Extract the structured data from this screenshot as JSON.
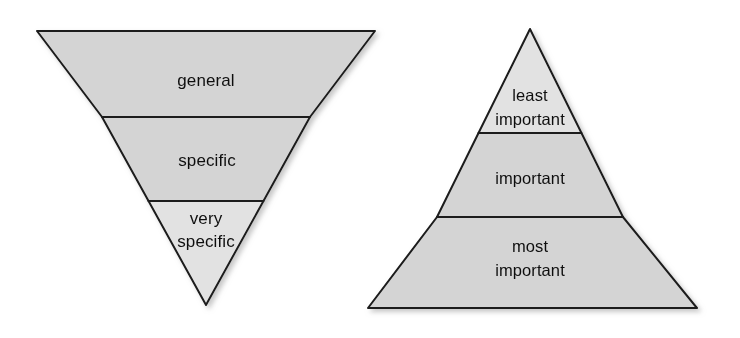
{
  "figure": {
    "title": "",
    "background_color": "#ffffff",
    "stroke_color": "#1a1a1a",
    "fill_light": "#e2e2e2",
    "fill_gray": "#d4d4d4",
    "diagrams": [
      {
        "name": "inverted-triangle-specificity",
        "shape": "inverted-triangle",
        "orientation": "point-down",
        "bands_top_to_bottom": [
          {
            "id": "general",
            "lines": [
              "general"
            ],
            "fill": "#d4d4d4"
          },
          {
            "id": "specific",
            "lines": [
              "specific"
            ],
            "fill": "#d4d4d4"
          },
          {
            "id": "very-specific",
            "lines": [
              "very",
              "specific"
            ],
            "fill": "#e2e2e2"
          }
        ]
      },
      {
        "name": "pyramid-importance",
        "shape": "triangle",
        "orientation": "point-up",
        "bands_top_to_bottom": [
          {
            "id": "least-important",
            "lines": [
              "least",
              "important"
            ],
            "fill": "#e2e2e2"
          },
          {
            "id": "important",
            "lines": [
              "important"
            ],
            "fill": "#d4d4d4"
          },
          {
            "id": "most-important",
            "lines": [
              "most",
              "important"
            ],
            "fill": "#d4d4d4"
          }
        ]
      }
    ]
  },
  "labels": {
    "left": {
      "band1": "general",
      "band2": "specific",
      "band3_line1": "very",
      "band3_line2": "specific"
    },
    "right": {
      "band1_line1": "least",
      "band1_line2": "important",
      "band2": "important",
      "band3_line1": "most",
      "band3_line2": "important"
    }
  }
}
